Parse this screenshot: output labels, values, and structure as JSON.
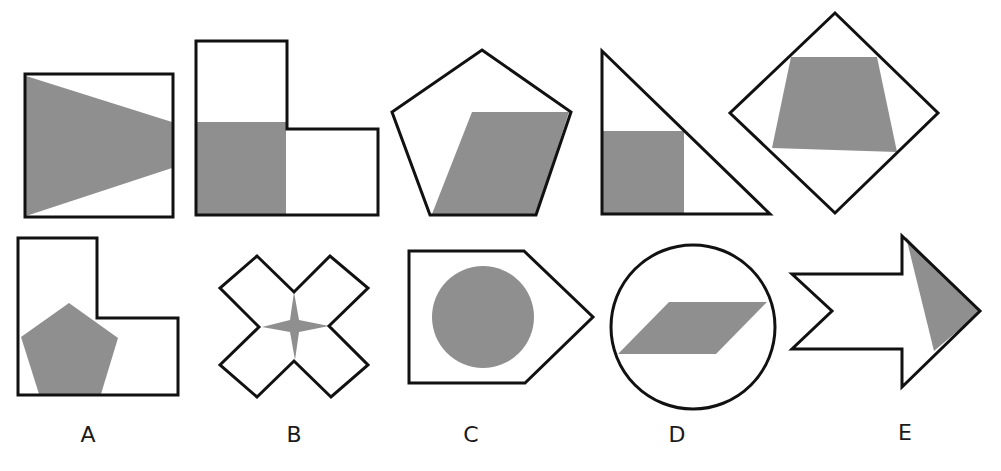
{
  "figure": {
    "colors": {
      "outline": "#111111",
      "shade": "#8f8f8f",
      "background": "#ffffff"
    },
    "example_row": [
      {
        "outer_shape": "square",
        "shaded_shape": "triangle"
      },
      {
        "outer_shape": "L-shape",
        "shaded_shape": "square"
      },
      {
        "outer_shape": "pentagon",
        "shaded_shape": "parallelogram"
      },
      {
        "outer_shape": "right-triangle",
        "shaded_shape": "square"
      },
      {
        "outer_shape": "diamond",
        "shaded_shape": "trapezoid"
      }
    ],
    "options": [
      {
        "label": "A",
        "outer_shape": "L-shape",
        "shaded_shape": "pentagon"
      },
      {
        "label": "B",
        "outer_shape": "X-cross",
        "shaded_shape": "four-point-star"
      },
      {
        "label": "C",
        "outer_shape": "pentagon-arrow",
        "shaded_shape": "circle"
      },
      {
        "label": "D",
        "outer_shape": "circle",
        "shaded_shape": "parallelogram"
      },
      {
        "label": "E",
        "outer_shape": "arrow",
        "shaded_shape": "triangle"
      }
    ]
  }
}
